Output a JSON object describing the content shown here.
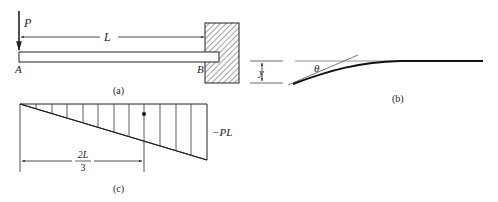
{
  "figure_a": {
    "load_label": "P",
    "length_label": "L",
    "end_a_label": "A",
    "end_b_label": "B",
    "caption": "(a)"
  },
  "figure_b": {
    "deflection_label": "y",
    "angle_label": "θ",
    "caption": "(b)"
  },
  "figure_c": {
    "moment_label": "−PL",
    "distance_numerator": "2L",
    "distance_denominator": "3",
    "caption": "(c)"
  },
  "colors": {
    "ink": "#222222",
    "background": "#ffffff"
  }
}
